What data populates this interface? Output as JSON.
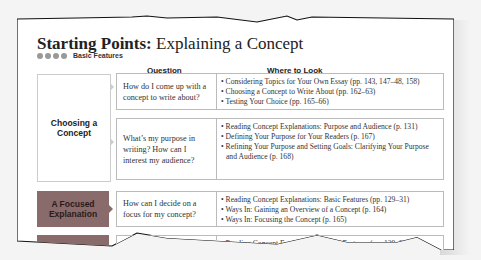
{
  "title": {
    "bold": "Starting Points:",
    "rest": " Explaining a Concept"
  },
  "subtitle": {
    "dots": 4,
    "label": "Basic Features"
  },
  "columns": {
    "question": "Question",
    "where": "Where to Look"
  },
  "categories": [
    {
      "label": "Choosing a Concept",
      "style": "light"
    },
    {
      "label": "A Focused Explanation",
      "style": "dark"
    },
    {
      "label": "",
      "style": "dark"
    }
  ],
  "rows": [
    {
      "question": "How do I come up with a concept to write about?",
      "where": [
        "Considering Topics for Your Own Essay (pp. 143, 147–48, 158)",
        "Choosing a Concept to Write About (pp. 162–63)",
        "Testing Your Choice (pp. 165–66)"
      ]
    },
    {
      "question": "What’s my purpose in writing? How can I interest my audience?",
      "where": [
        "Reading Concept Explanations: Purpose and Audience (p. 131)",
        "Defining Your Purpose for Your Readers (p. 167)",
        "Refining Your Purpose and Setting Goals: Clarifying Your Purpose and Audience (p. 168)"
      ]
    },
    {
      "question": "How can I decide on a focus for my concept?",
      "where": [
        "Reading Concept Explanations: Basic Features (pp. 129–31)",
        "Ways In: Gaining an Overview of a Concept (p. 164)",
        "Ways In: Focusing the Concept (p. 165)"
      ]
    },
    {
      "question": "",
      "where": [
        "Reading Concept Explanations: Basic Features (pp. 129–31)"
      ]
    }
  ]
}
